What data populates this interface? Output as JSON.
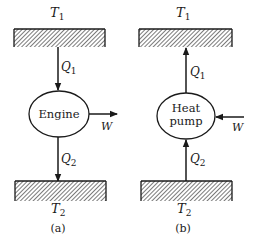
{
  "panels": [
    {
      "id": "a",
      "caption": "(a)",
      "hot_reservoir": {
        "symbol": "T",
        "subscript": "1"
      },
      "cold_reservoir": {
        "symbol": "T",
        "subscript": "2"
      },
      "device": {
        "label_line1": "Engine",
        "label_line2": ""
      },
      "heat_top": {
        "symbol": "Q",
        "subscript": "1",
        "direction": "down"
      },
      "heat_bottom": {
        "symbol": "Q",
        "subscript": "2",
        "direction": "down"
      },
      "work": {
        "symbol": "W",
        "direction": "out"
      }
    },
    {
      "id": "b",
      "caption": "(b)",
      "hot_reservoir": {
        "symbol": "T",
        "subscript": "1"
      },
      "cold_reservoir": {
        "symbol": "T",
        "subscript": "2"
      },
      "device": {
        "label_line1": "Heat",
        "label_line2": "pump"
      },
      "heat_top": {
        "symbol": "Q",
        "subscript": "1",
        "direction": "up"
      },
      "heat_bottom": {
        "symbol": "Q",
        "subscript": "2",
        "direction": "up"
      },
      "work": {
        "symbol": "W",
        "direction": "in"
      }
    }
  ],
  "colors": {
    "ink": "#1a1a1a",
    "background": "#ffffff"
  }
}
